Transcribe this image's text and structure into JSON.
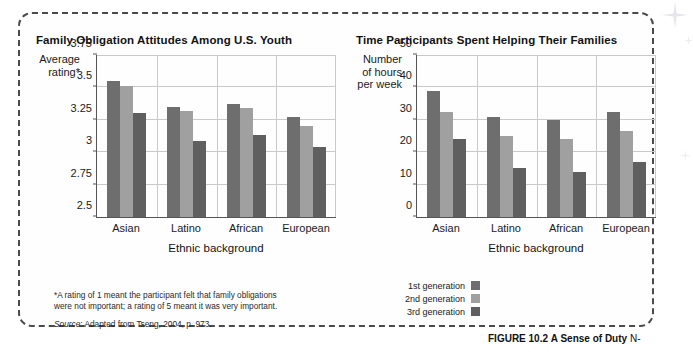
{
  "figure": {
    "caption_label": "FIGURE 10.2",
    "caption_title": "A Sense of Duty",
    "caption_tail": "N-"
  },
  "colors": {
    "gen1": "#6e6e6e",
    "gen2": "#a0a0a0",
    "gen3": "#5f5f5f",
    "grid": "#c9c9c9",
    "axis": "#555555",
    "border": "#4a4a4a"
  },
  "legend": {
    "items": [
      {
        "label": "1st generation",
        "color": "#6e6e6e"
      },
      {
        "label": "2nd generation",
        "color": "#a0a0a0"
      },
      {
        "label": "3rd generation",
        "color": "#5f5f5f"
      }
    ]
  },
  "footnote": {
    "line1": "*A rating of 1 meant the participant felt that family obligations",
    "line2": "were not important; a rating of 5 meant it was very important.",
    "source_label": "Source",
    "source_text": ": Adapted from Tseng, 2004, p. 973."
  },
  "chart_data": [
    {
      "type": "bar",
      "id": "left",
      "title": "Family Obligation Attitudes Among U.S. Youth",
      "ylabel": "Average rating*",
      "ylabel_lines": [
        "Average",
        "rating*"
      ],
      "xlabel": "Ethnic background",
      "categories": [
        "Asian",
        "Latino",
        "African",
        "European"
      ],
      "ylim": [
        2.5,
        3.75
      ],
      "yticks": [
        2.5,
        2.75,
        3,
        3.25,
        3.5,
        3.75
      ],
      "ytick_labels": [
        "2.5",
        "2.75",
        "3",
        "3.25",
        "3.5",
        "3.75"
      ],
      "grid": true,
      "legend_position": "below-center",
      "series": [
        {
          "name": "1st generation",
          "color": "#6e6e6e",
          "values": [
            3.55,
            3.35,
            3.37,
            3.27
          ]
        },
        {
          "name": "2nd generation",
          "color": "#a0a0a0",
          "values": [
            3.51,
            3.32,
            3.34,
            3.2
          ]
        },
        {
          "name": "3rd generation",
          "color": "#5f5f5f",
          "values": [
            3.3,
            3.09,
            3.13,
            3.04
          ]
        }
      ]
    },
    {
      "type": "bar",
      "id": "right",
      "title": "Time Participants Spent Helping Their Families",
      "ylabel": "Number of hours per week",
      "ylabel_lines": [
        "Number",
        "of hours",
        "per week"
      ],
      "xlabel": "Ethnic background",
      "categories": [
        "Asian",
        "Latino",
        "African",
        "European"
      ],
      "ylim": [
        0,
        50
      ],
      "yticks": [
        0,
        10,
        20,
        30,
        40,
        50
      ],
      "ytick_labels": [
        "0",
        "10",
        "20",
        "30",
        "40",
        "50"
      ],
      "grid": true,
      "legend_position": "below-center",
      "series": [
        {
          "name": "1st generation",
          "color": "#6e6e6e",
          "values": [
            39,
            31,
            30,
            32.5
          ]
        },
        {
          "name": "2nd generation",
          "color": "#a0a0a0",
          "values": [
            32.5,
            25,
            24,
            26.5
          ]
        },
        {
          "name": "3rd generation",
          "color": "#5f5f5f",
          "values": [
            24,
            15,
            14,
            17
          ]
        }
      ]
    }
  ]
}
